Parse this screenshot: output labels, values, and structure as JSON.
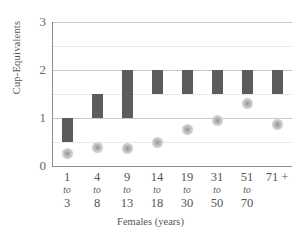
{
  "chart_data": {
    "type": "bar",
    "title": "",
    "subtitle": "",
    "xlabel": "Females (years)",
    "ylabel": "Cup-Equivalents",
    "categories": [
      "1 to 3",
      "4 to 8",
      "9 to 13",
      "14 to 18",
      "19 to 30",
      "31 to 50",
      "51 to 70",
      "71 +"
    ],
    "category_parts": [
      {
        "first": "1",
        "to": "to",
        "second": "3"
      },
      {
        "first": "4",
        "to": "to",
        "second": "8"
      },
      {
        "first": "9",
        "to": "to",
        "second": "13"
      },
      {
        "first": "14",
        "to": "to",
        "second": "18"
      },
      {
        "first": "19",
        "to": "to",
        "second": "30"
      },
      {
        "first": "31",
        "to": "to",
        "second": "50"
      },
      {
        "first": "51",
        "to": "to",
        "second": "70"
      },
      {
        "first": "71 +",
        "to": "",
        "second": ""
      }
    ],
    "ylim": [
      0,
      3
    ],
    "yticks": [
      0,
      1,
      2,
      3
    ],
    "ytick_labels": [
      "0",
      "1",
      "2",
      "3"
    ],
    "minor_gridlines": [
      0.5,
      1.5,
      2.5
    ],
    "grid": true,
    "legend": "none",
    "series": [
      {
        "name": "Recommended intake range",
        "type": "range-bar",
        "color": "#5c5c5c",
        "low": [
          0.5,
          1.0,
          1.0,
          1.5,
          1.5,
          1.5,
          1.5,
          1.5
        ],
        "high": [
          1.0,
          1.5,
          2.0,
          2.0,
          2.0,
          2.0,
          2.0,
          2.0
        ]
      },
      {
        "name": "Average intake",
        "type": "marker",
        "color": "#b5b5b5",
        "values": [
          0.27,
          0.38,
          0.37,
          0.48,
          0.76,
          0.95,
          1.31,
          0.87
        ]
      }
    ]
  },
  "colors": {
    "bar": "#5c5c5c",
    "dot_fill": "#b5b5b5",
    "dot_ring": "#cfcfcf",
    "axis": "#8e8e8e",
    "gridline": "#c9c9c9",
    "gridline_minor": "#d8d8d8",
    "text": "#555555",
    "background": "#ffffff"
  }
}
